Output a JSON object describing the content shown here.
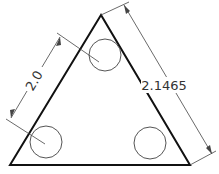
{
  "drawing": {
    "type": "technical-drawing",
    "shape": "equilateral-triangle-with-three-holes",
    "colors": {
      "background": "#ffffff",
      "outline": "#111111",
      "circle": "#555555",
      "dimension": "#444444"
    },
    "triangle": {
      "apex": [
        101,
        15
      ],
      "bottom_left": [
        10,
        165
      ],
      "bottom_right": [
        190,
        165
      ]
    },
    "circles": [
      {
        "name": "top-hole",
        "cx": 105,
        "cy": 55,
        "r": 16
      },
      {
        "name": "bottom-left-hole",
        "cx": 46,
        "cy": 142,
        "r": 16
      },
      {
        "name": "bottom-right-hole",
        "cx": 150,
        "cy": 143,
        "r": 16
      }
    ],
    "dimensions": {
      "hole_spacing": {
        "label": "2.0"
      },
      "side_length": {
        "label": "2.1465"
      }
    }
  }
}
